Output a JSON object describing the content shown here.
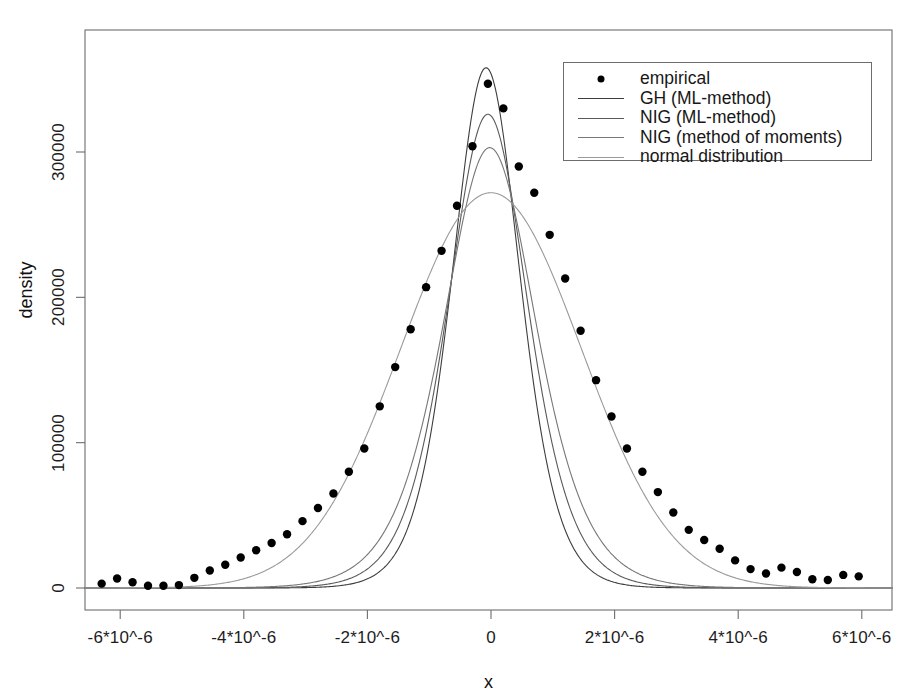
{
  "figure": {
    "width": 917,
    "height": 698,
    "background": "#ffffff"
  },
  "axes": {
    "xlabel": "x",
    "ylabel": "density",
    "x_ticks": [
      "-6*10^-6",
      "-4*10^-6",
      "-2*10^-6",
      "0",
      "2*10^-6",
      "4*10^-6",
      "6*10^-6"
    ],
    "x_tick_values": [
      -6e-06,
      -4e-06,
      -2e-06,
      0,
      2e-06,
      4e-06,
      6e-06
    ],
    "y_ticks": [
      "0",
      "100000",
      "200000",
      "300000"
    ],
    "y_tick_values": [
      0,
      100000,
      200000,
      300000
    ],
    "box_color": "#6d6d6d",
    "text_color": "#1a1a1a"
  },
  "legend": {
    "position": "top-right",
    "border_color": "#6d6d6d",
    "background": "#ffffff",
    "entries": [
      {
        "label": "empirical",
        "marker": "point",
        "color": "#000000",
        "dash": "none"
      },
      {
        "label": "GH (ML-method)",
        "marker": "line",
        "color": "#3d3d3d",
        "dash": "solid"
      },
      {
        "label": "NIG (ML-method)",
        "marker": "line",
        "color": "#5a5a5a",
        "dash": "solid"
      },
      {
        "label": "NIG (method of moments)",
        "marker": "line",
        "color": "#777777",
        "dash": "solid"
      },
      {
        "label": "normal distribution",
        "marker": "line",
        "color": "#9a9a9a",
        "dash": "solid"
      }
    ]
  },
  "chart_data": {
    "type": "line",
    "title": "",
    "xlabel": "x",
    "ylabel": "density",
    "xlim": [
      -6.6e-06,
      6.6e-06
    ],
    "ylim": [
      -12000,
      372000
    ],
    "grid": false,
    "legend_position": "top-right",
    "x_scale_note": "x values in units of 1e-6",
    "empirical": {
      "name": "empirical",
      "type": "scatter",
      "marker": "filled-circle",
      "color": "#000000",
      "x": [
        -6.3,
        -6.05,
        -5.8,
        -5.55,
        -5.3,
        -5.05,
        -4.8,
        -4.55,
        -4.3,
        -4.05,
        -3.8,
        -3.55,
        -3.3,
        -3.05,
        -2.8,
        -2.55,
        -2.3,
        -2.05,
        -1.8,
        -1.55,
        -1.3,
        -1.05,
        -0.8,
        -0.55,
        -0.3,
        -0.05,
        0.2,
        0.45,
        0.7,
        0.95,
        1.2,
        1.45,
        1.7,
        1.95,
        2.2,
        2.45,
        2.7,
        2.95,
        3.2,
        3.45,
        3.7,
        3.95,
        4.2,
        4.45,
        4.7,
        4.95,
        5.2,
        5.45,
        5.7,
        5.95
      ],
      "y": [
        3000,
        6500,
        4000,
        1500,
        1500,
        2000,
        7000,
        12000,
        16000,
        21000,
        26000,
        31000,
        37000,
        46000,
        55000,
        65000,
        80000,
        96000,
        125000,
        152000,
        178000,
        207000,
        232000,
        263000,
        304000,
        347000,
        330000,
        290000,
        272000,
        243000,
        213000,
        177000,
        143000,
        118000,
        96000,
        80000,
        66000,
        52000,
        40000,
        33000,
        27000,
        19000,
        13000,
        10000,
        14000,
        11000,
        6000,
        5500,
        9000,
        8000
      ]
    },
    "series": [
      {
        "name": "GH (ML-method)",
        "color": "#3d3d3d",
        "dash": "solid",
        "linewidth": 1.1,
        "peak": 358000,
        "peak_x": -0.08,
        "shape": "generalized-hyperbolic",
        "scale": 0.92,
        "tail": 1.55
      },
      {
        "name": "NIG (ML-method)",
        "color": "#5a5a5a",
        "dash": "solid",
        "linewidth": 1.1,
        "peak": 326000,
        "peak_x": -0.05,
        "shape": "normal-inverse-gaussian",
        "scale": 1.02,
        "tail": 1.62
      },
      {
        "name": "NIG (method of moments)",
        "color": "#777777",
        "dash": "solid",
        "linewidth": 1.1,
        "peak": 303000,
        "peak_x": -0.02,
        "shape": "normal-inverse-gaussian",
        "scale": 1.12,
        "tail": 1.7
      },
      {
        "name": "normal distribution",
        "color": "#9a9a9a",
        "dash": "solid",
        "linewidth": 1.1,
        "peak": 272000,
        "peak_x": 0.0,
        "shape": "gaussian",
        "scale": 1.46,
        "tail": 2.0
      }
    ]
  }
}
